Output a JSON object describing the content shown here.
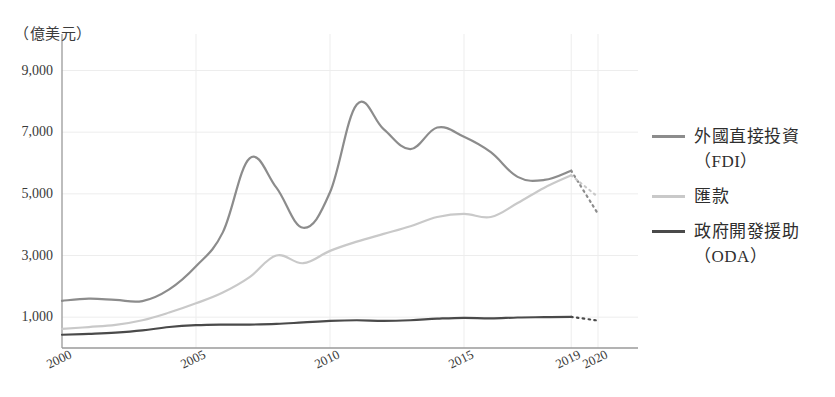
{
  "axis": {
    "unit_label": "（億美元）",
    "y_ticks": [
      "1,000",
      "3,000",
      "5,000",
      "7,000",
      "9,000"
    ],
    "y_tick_values": [
      1000,
      3000,
      5000,
      7000,
      9000
    ],
    "x_ticks": [
      "2000",
      "2005",
      "2010",
      "2015",
      "2019",
      "2020"
    ],
    "x_tick_values": [
      2000,
      2005,
      2010,
      2015,
      2019,
      2020
    ]
  },
  "legend": {
    "items": [
      {
        "label": "外國直接投資\n（FDI）",
        "color": "#8c8c8c",
        "key": "fdi"
      },
      {
        "label": "匯款",
        "color": "#c9c9c9",
        "key": "remittances"
      },
      {
        "label": "政府開發援助\n（ODA）",
        "color": "#4a4a4a",
        "key": "oda"
      }
    ]
  },
  "colors": {
    "fdi": "#8c8c8c",
    "remittances": "#c9c9c9",
    "oda": "#4a4a4a",
    "axis": "#9a9a9a",
    "grid": "#ededed",
    "text": "#3a3a3a"
  },
  "chart_data": {
    "type": "line",
    "title": "",
    "subtitle": "",
    "xlabel": "",
    "ylabel": "（億美元）",
    "xlim": [
      2000,
      2020
    ],
    "ylim": [
      0,
      9600
    ],
    "grid": true,
    "legend_position": "right",
    "x": [
      2000,
      2001,
      2002,
      2003,
      2004,
      2005,
      2006,
      2007,
      2008,
      2009,
      2010,
      2011,
      2012,
      2013,
      2014,
      2015,
      2016,
      2017,
      2018,
      2019,
      2020
    ],
    "series": [
      {
        "name": "外國直接投資（FDI）",
        "key": "fdi",
        "color": "#8c8c8c",
        "values": [
          1530,
          1600,
          1560,
          1520,
          1900,
          2650,
          3750,
          6150,
          5200,
          3900,
          5050,
          7900,
          7100,
          6450,
          7150,
          6850,
          6350,
          5550,
          5450,
          5750,
          4350
        ],
        "projected_from": 2019,
        "projected_style": "dotted"
      },
      {
        "name": "匯款",
        "key": "remittances",
        "color": "#c9c9c9",
        "values": [
          620,
          680,
          750,
          900,
          1150,
          1450,
          1800,
          2300,
          3000,
          2750,
          3150,
          3450,
          3700,
          3950,
          4250,
          4350,
          4250,
          4700,
          5200,
          5600,
          4900
        ],
        "projected_from": 2019,
        "projected_style": "dotted"
      },
      {
        "name": "政府開發援助（ODA）",
        "key": "oda",
        "color": "#4a4a4a",
        "values": [
          430,
          460,
          500,
          570,
          680,
          740,
          760,
          760,
          780,
          830,
          880,
          900,
          880,
          900,
          950,
          980,
          960,
          990,
          1000,
          1010,
          890
        ],
        "projected_from": 2019,
        "projected_style": "dotted"
      }
    ]
  },
  "plot_geometry": {
    "left": 62,
    "right": 598,
    "top": 52,
    "bottom": 348
  }
}
